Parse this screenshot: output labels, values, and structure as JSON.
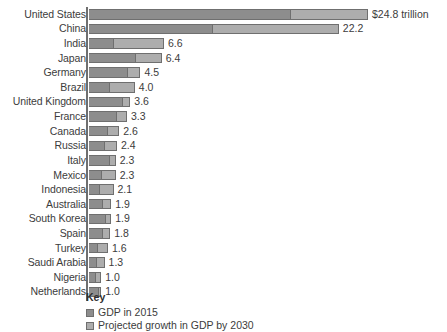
{
  "chart_data": {
    "type": "bar",
    "subtype": "stacked-horizontal",
    "title": "",
    "xlabel": "",
    "ylabel": "",
    "unit": "trillion USD",
    "grid": false,
    "legend_position": "bottom-left",
    "xlim": [
      0,
      24.8
    ],
    "categories": [
      "United States",
      "China",
      "India",
      "Japan",
      "Germany",
      "Brazil",
      "United Kingdom",
      "France",
      "Canada",
      "Russia",
      "Italy",
      "Mexico",
      "Indonesia",
      "Australia",
      "South Korea",
      "Spain",
      "Turkey",
      "Saudi Arabia",
      "Nigeria",
      "Netherlands"
    ],
    "series": [
      {
        "name": "GDP in 2015",
        "color": "#8d8d8d",
        "values": [
          17.9,
          11.0,
          2.1,
          4.1,
          3.4,
          1.8,
          2.9,
          2.4,
          1.6,
          1.3,
          1.8,
          1.1,
          0.9,
          1.2,
          1.4,
          1.2,
          0.7,
          0.6,
          0.5,
          0.8
        ]
      },
      {
        "name": "Projected growth in GDP by 2030",
        "color": "#adadad",
        "values": [
          6.9,
          11.2,
          4.5,
          2.3,
          1.1,
          2.2,
          0.7,
          0.9,
          1.0,
          1.1,
          0.5,
          1.2,
          1.2,
          0.7,
          0.5,
          0.6,
          0.9,
          0.7,
          0.5,
          0.2
        ]
      }
    ],
    "totals": [
      24.8,
      22.2,
      6.6,
      6.4,
      4.5,
      4.0,
      3.6,
      3.3,
      2.6,
      2.4,
      2.3,
      2.3,
      2.1,
      1.9,
      1.9,
      1.8,
      1.6,
      1.3,
      1.0,
      1.0
    ],
    "value_labels": [
      "$24.8 trillion",
      "22.2",
      "6.6",
      "6.4",
      "4.5",
      "4.0",
      "3.6",
      "3.3",
      "2.6",
      "2.4",
      "2.3",
      "2.3",
      "2.1",
      "1.9",
      "1.9",
      "1.8",
      "1.6",
      "1.3",
      "1.0",
      "1.0"
    ]
  },
  "legend": {
    "title": "Key",
    "items": [
      {
        "label": "GDP in 2015",
        "color": "#8d8d8d"
      },
      {
        "label": "Projected growth in GDP by 2030",
        "color": "#adadad"
      }
    ]
  }
}
